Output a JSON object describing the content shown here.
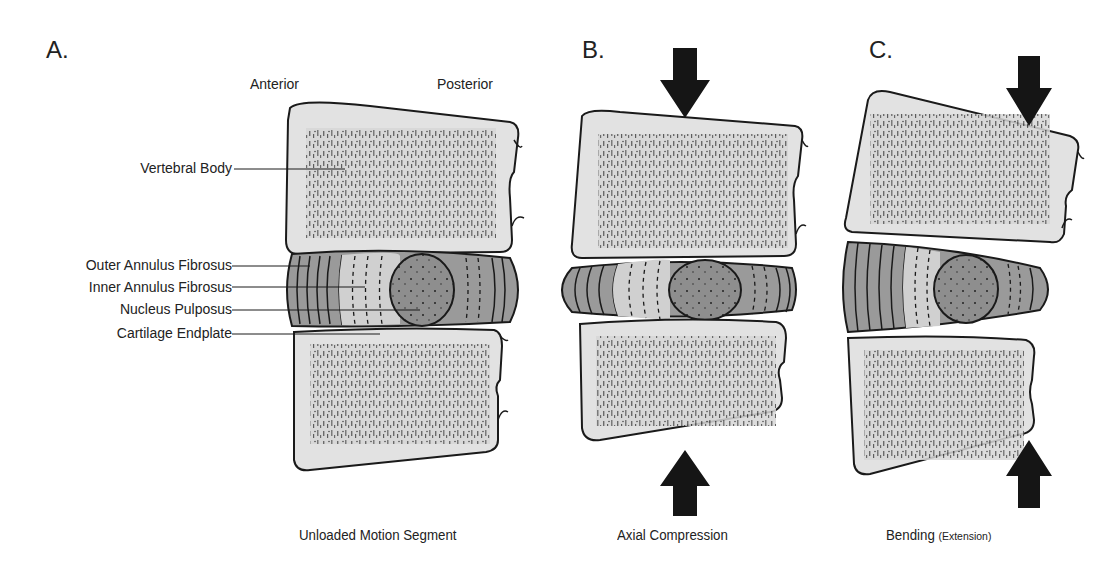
{
  "panels": [
    {
      "letter": "A.",
      "caption": "Unloaded Motion Segment",
      "orientation": {
        "left": "Anterior",
        "right": "Posterior"
      },
      "labels": [
        "Vertebral Body",
        "Outer Annulus Fibrosus",
        "Inner Annulus Fibrosus",
        "Nucleus Pulposus",
        "Cartilage Endplate"
      ]
    },
    {
      "letter": "B.",
      "caption": "Axial Compression",
      "arrows": [
        "down-top",
        "up-bottom"
      ]
    },
    {
      "letter": "C.",
      "caption_main": "Bending",
      "caption_sub": "(Extension)",
      "arrows": [
        "down-top-posterior",
        "up-bottom-posterior"
      ]
    }
  ],
  "colors": {
    "bone_fill": "#e2e2e2",
    "outline": "#1a1a1a",
    "outer_annulus": "#9a9a9a",
    "inner_annulus": "#cfcfcf",
    "nucleus": "#8e8e8e",
    "arrow": "#151515"
  }
}
